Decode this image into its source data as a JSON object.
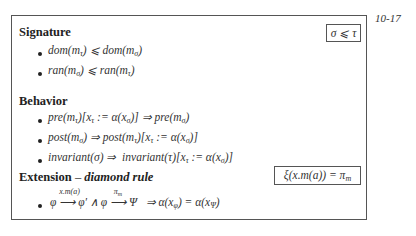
{
  "page_number": "10-17",
  "signature": {
    "title": "Signature",
    "constraint_box": "σ ⩽ τ",
    "items": [
      "dom(mτ) ⩽ dom(mσ)",
      "ran(mσ) ⩽ ran(mτ)"
    ]
  },
  "behavior": {
    "title": "Behavior",
    "items": [
      "pre(mτ)[xτ := α(xσ)] ⇒ pre(mσ)",
      "post(mσ) ⇒ post(mτ)[xτ := α(xσ)]",
      "invariant(σ) ⇒  invariant(τ)[xτ := α(xσ)]"
    ]
  },
  "extension": {
    "title": "Extension",
    "dash": "–",
    "subtitle": "diamond rule",
    "rule_box": "ξ(x.m(a)) = πm",
    "item": {
      "phi": "φ",
      "arrow1_label": "x.m(a)",
      "phi_prime": "φ′ ∧ φ",
      "arrow2_label": "πm",
      "psi": "Ψ",
      "implies": "⇒ α(xφ) = α(xΨ)"
    }
  }
}
